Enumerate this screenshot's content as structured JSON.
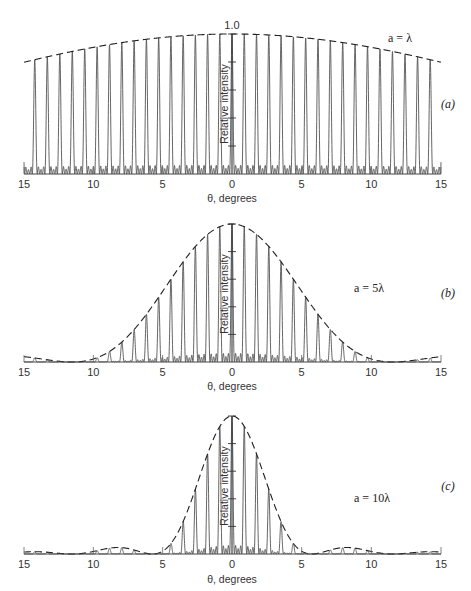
{
  "chart_data": [
    {
      "type": "line",
      "panel_label": "(a)",
      "annotation": "a = λ",
      "slit_width_over_lambda": 1,
      "title": "",
      "xlabel": "θ, degrees",
      "ylabel": "Relative intensity",
      "x_ticks": [
        "15",
        "10",
        "5",
        "0",
        "5",
        "10",
        "15"
      ],
      "x_tick_values": [
        -15,
        -10,
        -5,
        0,
        5,
        10,
        15
      ],
      "y_tick_label_top": "1.0",
      "xlim": [
        -15,
        15
      ],
      "ylim": [
        0,
        1.0
      ],
      "y_minor_ticks": [
        0.2,
        0.4,
        0.6,
        0.8
      ],
      "envelope": "dashed single-slit envelope",
      "principal_max_spacing_deg": 0.88,
      "envelope_value_at_15deg": 0.8
    },
    {
      "type": "line",
      "panel_label": "(b)",
      "annotation": "a = 5λ",
      "slit_width_over_lambda": 5,
      "title": "",
      "xlabel": "θ, degrees",
      "ylabel": "Relative intensity",
      "x_ticks": [
        "15",
        "10",
        "5",
        "0",
        "5",
        "10",
        "15"
      ],
      "x_tick_values": [
        -15,
        -10,
        -5,
        0,
        5,
        10,
        15
      ],
      "xlim": [
        -15,
        15
      ],
      "ylim": [
        0,
        1.0
      ],
      "y_minor_ticks": [
        0.2,
        0.4,
        0.6,
        0.8
      ],
      "envelope": "dashed single-slit envelope",
      "principal_max_spacing_deg": 0.88,
      "envelope_first_zero_deg": 11.5
    },
    {
      "type": "line",
      "panel_label": "(c)",
      "annotation": "a = 10λ",
      "slit_width_over_lambda": 10,
      "title": "",
      "xlabel": "θ, degrees",
      "ylabel": "Relative intensity",
      "x_ticks": [
        "15",
        "10",
        "5",
        "0",
        "5",
        "10",
        "15"
      ],
      "x_tick_values": [
        -15,
        -10,
        -5,
        0,
        5,
        10,
        15
      ],
      "xlim": [
        -15,
        15
      ],
      "ylim": [
        0,
        1.0
      ],
      "y_minor_ticks": [
        0.2,
        0.4,
        0.6,
        0.8
      ],
      "envelope": "dashed single-slit envelope",
      "principal_max_spacing_deg": 0.88,
      "envelope_first_zero_deg": 5.7,
      "secondary_max_deg": 9.5
    }
  ],
  "layout": {
    "panels": [
      {
        "top": 34,
        "base": 174,
        "label_y": 188,
        "xtitle_y": 202,
        "ann_x": 400,
        "ann_y": 42,
        "plabel_x": 448,
        "plabel_y": 108,
        "ylabel_center_y": 104
      },
      {
        "top": 224,
        "base": 362,
        "label_y": 376,
        "xtitle_y": 390,
        "ann_x": 369,
        "ann_y": 292,
        "plabel_x": 448,
        "plabel_y": 297,
        "ylabel_center_y": 294
      },
      {
        "top": 416,
        "base": 554,
        "label_y": 568,
        "xtitle_y": 583,
        "ann_x": 372,
        "ann_y": 502,
        "plabel_x": 448,
        "plabel_y": 490,
        "ylabel_center_y": 486
      }
    ],
    "x_left": 24,
    "x_center": 232,
    "x_right": 441
  }
}
